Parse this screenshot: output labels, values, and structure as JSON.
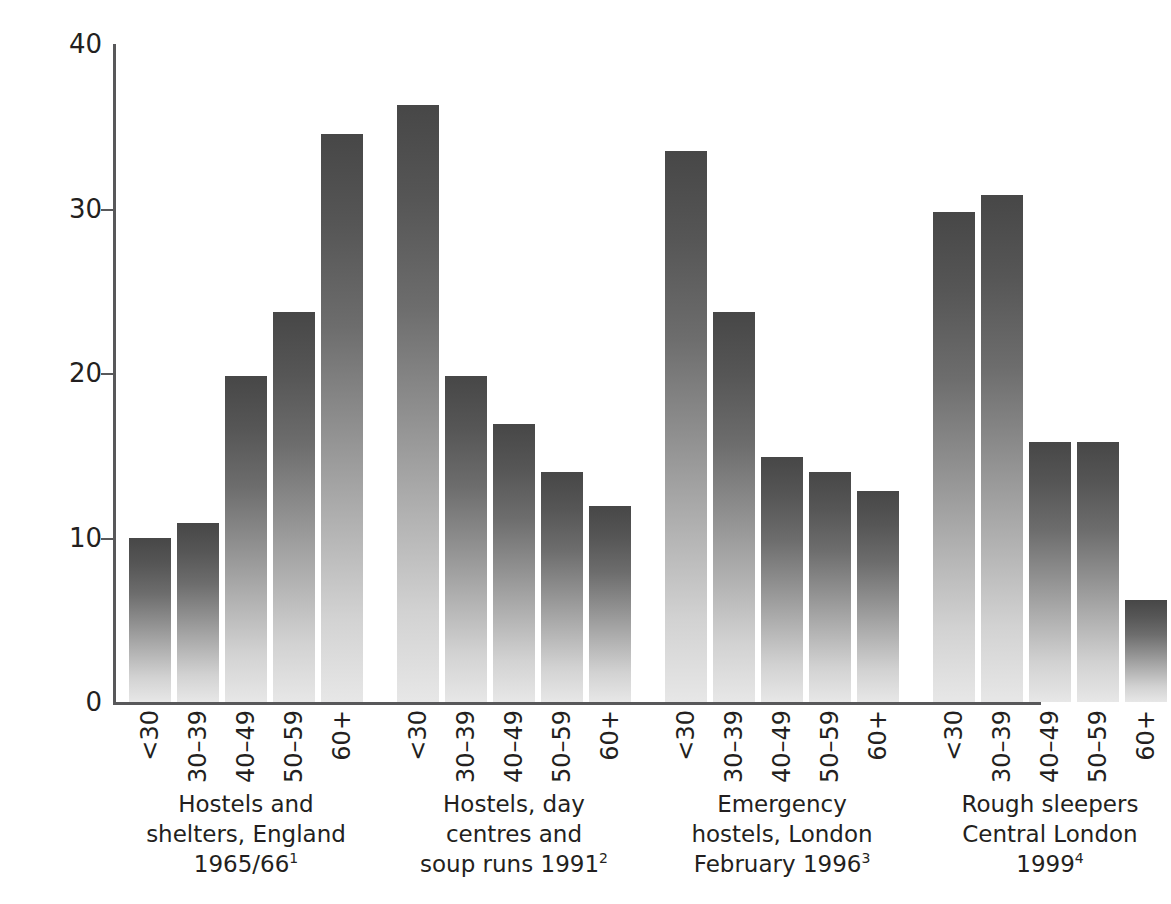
{
  "chart_data": {
    "type": "bar",
    "title": "",
    "xlabel": "",
    "ylabel": "Percentage of all ages",
    "ylim": [
      0,
      40
    ],
    "ytick_labels": [
      "40",
      "30",
      "20",
      "10",
      "0"
    ],
    "ytick_values": [
      40,
      30,
      20,
      10,
      0
    ],
    "grid": false,
    "legend": "none",
    "categories": [
      "<30",
      "30–39",
      "40–49",
      "50–59",
      "60+"
    ],
    "groups": [
      {
        "caption_lines": [
          "Hostels and",
          "shelters, England",
          "1965/66"
        ],
        "footnote_marker": "1",
        "values": [
          10.0,
          10.9,
          19.8,
          23.7,
          34.5
        ]
      },
      {
        "caption_lines": [
          "Hostels, day",
          "centres and",
          "soup runs 1991"
        ],
        "footnote_marker": "2",
        "values": [
          36.3,
          19.8,
          16.9,
          14.0,
          11.9
        ]
      },
      {
        "caption_lines": [
          "Emergency",
          "hostels, London",
          "February 1996"
        ],
        "footnote_marker": "3",
        "values": [
          33.5,
          23.7,
          14.9,
          14.0,
          12.8
        ]
      },
      {
        "caption_lines": [
          "Rough sleepers",
          "Central London",
          "1999"
        ],
        "footnote_marker": "4",
        "values": [
          29.8,
          30.8,
          15.8,
          15.8,
          6.2
        ]
      }
    ]
  },
  "colors": {
    "axis": "#58585a",
    "text": "#231f20",
    "bar_top": "#474747",
    "bar_bottom": "#e7e7e7",
    "background": "#ffffff"
  }
}
